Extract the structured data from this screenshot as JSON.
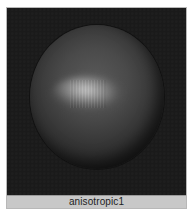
{
  "swatch": {
    "name": "anisotropic1",
    "material_type": "anisotropic",
    "preview_shape": "sphere",
    "colors": {
      "background": "#1a1a1a",
      "label_bar": "#c8c8c8",
      "label_text": "#1e1e1e",
      "border": "#b8b8b8"
    }
  }
}
